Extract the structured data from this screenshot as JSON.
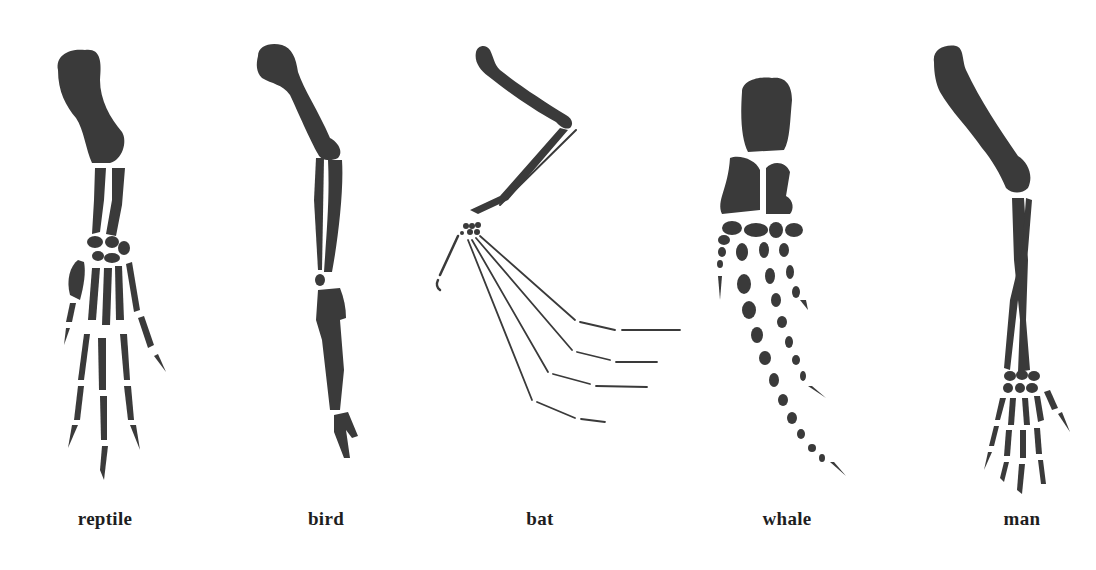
{
  "figure": {
    "ink_color": "#3a3a3a",
    "background": "#ffffff",
    "specimens": [
      {
        "id": "reptile",
        "label": "reptile",
        "label_x": 105
      },
      {
        "id": "bird",
        "label": "bird",
        "label_x": 326
      },
      {
        "id": "bat",
        "label": "bat",
        "label_x": 540
      },
      {
        "id": "whale",
        "label": "whale",
        "label_x": 787
      },
      {
        "id": "man",
        "label": "man",
        "label_x": 1022
      }
    ]
  }
}
